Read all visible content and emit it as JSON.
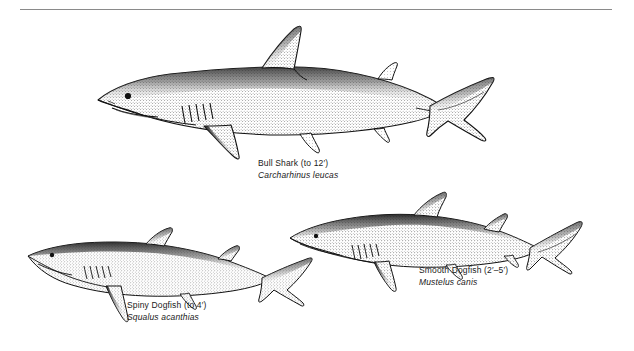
{
  "plate": {
    "background_color": "#ffffff",
    "ink_color": "#1a1a1a",
    "rule_color": "#8a8a8a",
    "rule": {
      "name": "horizontal-rule"
    }
  },
  "figures": [
    {
      "id": "bull",
      "icon_name": "bull-shark-illustration",
      "common_name": "Bull Shark (to 12′)",
      "scientific_name": "Carcharhinus leucas",
      "facing": "left",
      "style": "stippled pen-and-ink"
    },
    {
      "id": "spiny",
      "icon_name": "spiny-dogfish-illustration",
      "common_name": "Spiny Dogfish (to 4′)",
      "scientific_name": "Squalus acanthias",
      "facing": "left",
      "style": "stippled pen-and-ink"
    },
    {
      "id": "smooth",
      "icon_name": "smooth-dogfish-illustration",
      "common_name": "Smooth Dogfish (2′–5′)",
      "scientific_name": "Mustelus canis",
      "facing": "left",
      "style": "stippled pen-and-ink"
    }
  ]
}
